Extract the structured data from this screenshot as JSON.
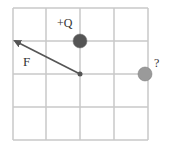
{
  "diagram": {
    "grid": {
      "x_lines": [
        13,
        46,
        80,
        114,
        148
      ],
      "y_lines": [
        8,
        41,
        74,
        107,
        140
      ],
      "line_color": "#c8c8c8"
    },
    "charges": [
      {
        "id": "plus-q",
        "label": "+Q",
        "cx": 80,
        "cy": 41,
        "r": 7,
        "fill": "#555555",
        "label_x": 57,
        "label_y": 27
      },
      {
        "id": "unknown",
        "label": "?",
        "cx": 145,
        "cy": 74,
        "r": 7,
        "fill": "#9a9a9a",
        "label_x": 154,
        "label_y": 67
      }
    ],
    "test_point": {
      "cx": 80,
      "cy": 74,
      "r": 2.5,
      "fill": "#555555"
    },
    "force_vector": {
      "label": "F",
      "x1": 80,
      "y1": 74,
      "x2": 15,
      "y2": 41,
      "color": "#555555",
      "label_x": 23,
      "label_y": 66
    }
  }
}
